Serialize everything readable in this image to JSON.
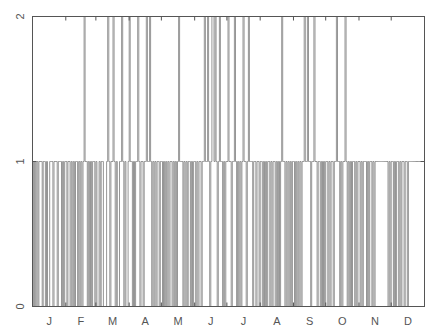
{
  "chart_data": {
    "type": "line",
    "style": "step",
    "title": "",
    "xlabel": "",
    "ylabel": "",
    "ylim": [
      0,
      2
    ],
    "xlim": [
      0,
      365
    ],
    "grid": false,
    "legend": null,
    "yticks": [
      0,
      1,
      2
    ],
    "ytick_labels": [
      "0",
      "1",
      "2"
    ],
    "months": [
      "J",
      "F",
      "M",
      "A",
      "M",
      "J",
      "J",
      "A",
      "S",
      "O",
      "N",
      "D"
    ],
    "month_starts": [
      0,
      31,
      59,
      90,
      120,
      151,
      181,
      212,
      243,
      273,
      304,
      334
    ],
    "line_color": "#8a8a8a",
    "axis_color": "#555555",
    "series": [
      {
        "name": "daily value",
        "baseline": 1,
        "spike_days_value_2": [
          48,
          70,
          75,
          83,
          90,
          98,
          106,
          109,
          136,
          160,
          163,
          167,
          168,
          170,
          174,
          182,
          188,
          196,
          201,
          232,
          253,
          256,
          262,
          283,
          291
        ],
        "drop_days_value_0": [
          1,
          3,
          5,
          9,
          12,
          14,
          15,
          19,
          23,
          27,
          29,
          32,
          35,
          37,
          39,
          42,
          44,
          46,
          51,
          53,
          55,
          58,
          60,
          61,
          63,
          66,
          67,
          68,
          72,
          77,
          79,
          80,
          85,
          87,
          88,
          93,
          95,
          100,
          103,
          111,
          113,
          115,
          118,
          121,
          123,
          125,
          127,
          130,
          132,
          134,
          140,
          142,
          144,
          147,
          149,
          152,
          154,
          157,
          165,
          172,
          177,
          179,
          185,
          190,
          192,
          194,
          199,
          205,
          208,
          211,
          214,
          216,
          218,
          221,
          223,
          226,
          228,
          230,
          235,
          237,
          239,
          241,
          244,
          246,
          248,
          250,
          259,
          265,
          268,
          270,
          272,
          275,
          277,
          280,
          286,
          288,
          293,
          295,
          297,
          300,
          302,
          305,
          307,
          311,
          313,
          316,
          318,
          331,
          333,
          336,
          338,
          341,
          343,
          346,
          349
        ]
      }
    ]
  }
}
